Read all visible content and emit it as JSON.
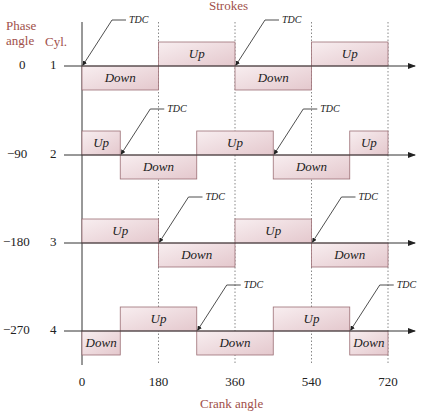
{
  "title": "Strokes",
  "xlabel": "Crank angle",
  "header": {
    "phase_label": "Phase\nangle",
    "phase_line1": "Phase",
    "phase_line2": "angle",
    "cyl_label": "Cyl."
  },
  "caption_fragment": "FIGURE",
  "colors": {
    "box_fill_top": "#f8eef0",
    "box_fill_bottom": "#e6cdd2",
    "box_stroke": "#9c6f75",
    "label": "#a0504a",
    "axis": "#333333",
    "grid": "#888888"
  },
  "x_ticks": [
    {
      "value": 0,
      "label": "0"
    },
    {
      "value": 180,
      "label": "180"
    },
    {
      "value": 360,
      "label": "360"
    },
    {
      "value": 540,
      "label": "540"
    },
    {
      "value": 720,
      "label": "720"
    }
  ],
  "tdc_label": "TDC",
  "cylinders": [
    {
      "cyl": "1",
      "phase": "0",
      "strokes": [
        {
          "start": 0,
          "end": 180,
          "dir": "Down"
        },
        {
          "start": 180,
          "end": 360,
          "dir": "Up"
        },
        {
          "start": 360,
          "end": 540,
          "dir": "Down"
        },
        {
          "start": 540,
          "end": 720,
          "dir": "Up"
        }
      ],
      "tdc": [
        0,
        360
      ]
    },
    {
      "cyl": "2",
      "phase": "−90",
      "strokes": [
        {
          "start": 0,
          "end": 90,
          "dir": "Up"
        },
        {
          "start": 90,
          "end": 270,
          "dir": "Down"
        },
        {
          "start": 270,
          "end": 450,
          "dir": "Up"
        },
        {
          "start": 450,
          "end": 630,
          "dir": "Down"
        },
        {
          "start": 630,
          "end": 720,
          "dir": "Up"
        }
      ],
      "tdc": [
        90,
        450
      ]
    },
    {
      "cyl": "3",
      "phase": "−180",
      "strokes": [
        {
          "start": 0,
          "end": 180,
          "dir": "Up"
        },
        {
          "start": 180,
          "end": 360,
          "dir": "Down"
        },
        {
          "start": 360,
          "end": 540,
          "dir": "Up"
        },
        {
          "start": 540,
          "end": 720,
          "dir": "Down"
        }
      ],
      "tdc": [
        180,
        540
      ]
    },
    {
      "cyl": "4",
      "phase": "−270",
      "strokes": [
        {
          "start": 0,
          "end": 90,
          "dir": "Down"
        },
        {
          "start": 90,
          "end": 270,
          "dir": "Up"
        },
        {
          "start": 270,
          "end": 450,
          "dir": "Down"
        },
        {
          "start": 450,
          "end": 630,
          "dir": "Up"
        },
        {
          "start": 630,
          "end": 720,
          "dir": "Down"
        }
      ],
      "tdc": [
        270,
        630
      ]
    }
  ]
}
